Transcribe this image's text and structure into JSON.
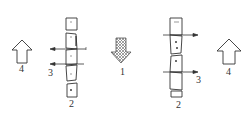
{
  "diagram": {
    "labels": {
      "left_up_arrow": "4",
      "left_side_arrows": "3",
      "left_column": "2",
      "center_down_arrow": "1",
      "right_column": "2",
      "right_side_arrows": "3",
      "right_up_arrow": "4"
    },
    "colors": {
      "stroke": "#333333",
      "hatch": "#888888",
      "background": "#ffffff"
    }
  }
}
